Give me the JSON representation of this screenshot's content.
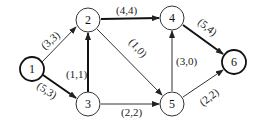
{
  "graph": {
    "nodes": [
      {
        "id": "1",
        "label": "1",
        "x": 32,
        "y": 69,
        "bold": true
      },
      {
        "id": "2",
        "label": "2",
        "x": 88,
        "y": 20,
        "bold": false
      },
      {
        "id": "3",
        "label": "3",
        "x": 88,
        "y": 104,
        "bold": false
      },
      {
        "id": "4",
        "label": "4",
        "x": 172,
        "y": 18,
        "bold": false
      },
      {
        "id": "5",
        "label": "5",
        "x": 172,
        "y": 104,
        "bold": false
      },
      {
        "id": "6",
        "label": "6",
        "x": 234,
        "y": 62,
        "bold": true
      }
    ],
    "edges": [
      {
        "from": "1",
        "to": "2",
        "label": "(3,3)",
        "bold": false
      },
      {
        "from": "1",
        "to": "3",
        "label": "(5,3)",
        "bold": true
      },
      {
        "from": "3",
        "to": "2",
        "label": "(1,1)",
        "bold": true
      },
      {
        "from": "2",
        "to": "4",
        "label": "(4,4)",
        "bold": true
      },
      {
        "from": "2",
        "to": "5",
        "label": "(1,0)",
        "bold": false
      },
      {
        "from": "3",
        "to": "5",
        "label": "(2,2)",
        "bold": false
      },
      {
        "from": "5",
        "to": "4",
        "label": "(3,0)",
        "bold": false
      },
      {
        "from": "4",
        "to": "6",
        "label": "(5,4)",
        "bold": true
      },
      {
        "from": "5",
        "to": "6",
        "label": "(2,2)",
        "bold": false
      }
    ]
  }
}
